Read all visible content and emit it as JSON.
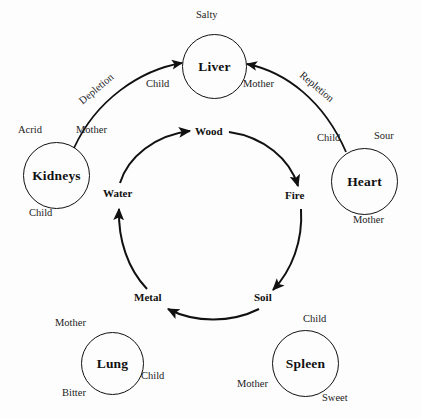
{
  "diagram": {
    "stroke_color": "#111111",
    "background_color": "#fdfdfd"
  },
  "organs": [
    {
      "id": "liver",
      "label": "Liver",
      "flavor": "Salty",
      "relations": [
        "Child",
        "Mother"
      ]
    },
    {
      "id": "kidneys",
      "label": "Kidneys",
      "flavor": "Acrid",
      "relations": [
        "Mother",
        "Child"
      ]
    },
    {
      "id": "heart",
      "label": "Heart",
      "flavor": "Sour",
      "relations": [
        "Child",
        "Mother"
      ]
    },
    {
      "id": "lung",
      "label": "Lung",
      "flavor": "Bitter",
      "relations": [
        "Mother",
        "Child"
      ]
    },
    {
      "id": "spleen",
      "label": "Spleen",
      "flavor": "Sweet",
      "relations": [
        "Child",
        "Mother"
      ]
    }
  ],
  "phases": [
    {
      "id": "wood",
      "label": "Wood"
    },
    {
      "id": "fire",
      "label": "Fire"
    },
    {
      "id": "soil",
      "label": "Soil"
    },
    {
      "id": "metal",
      "label": "Metal"
    },
    {
      "id": "water",
      "label": "Water"
    }
  ],
  "outer_arcs": [
    {
      "id": "depletion",
      "label": "Depletion",
      "from": "Kidneys",
      "to": "Liver"
    },
    {
      "id": "repletion",
      "label": "Repletion",
      "from": "Heart",
      "to": "Liver"
    }
  ],
  "labels": {
    "liver_name": "Liver",
    "liver_flavor": "Salty",
    "liver_child": "Child",
    "liver_mother": "Mother",
    "kidneys_name": "Kidneys",
    "kidneys_flavor": "Acrid",
    "kidneys_mother": "Mother",
    "kidneys_child": "Child",
    "heart_name": "Heart",
    "heart_flavor": "Sour",
    "heart_child": "Child",
    "heart_mother": "Mother",
    "lung_name": "Lung",
    "lung_flavor": "Bitter",
    "lung_mother": "Mother",
    "lung_child": "Child",
    "spleen_name": "Spleen",
    "spleen_flavor": "Sweet",
    "spleen_child": "Child",
    "spleen_mother": "Mother",
    "phase_wood": "Wood",
    "phase_fire": "Fire",
    "phase_soil": "Soil",
    "phase_metal": "Metal",
    "phase_water": "Water",
    "arc_depletion": "Depletion",
    "arc_repletion": "Repletion"
  }
}
